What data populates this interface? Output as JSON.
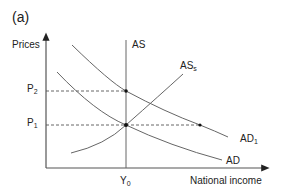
{
  "panel_label": "(a)",
  "axes": {
    "y_label": "Prices",
    "x_label": "National income"
  },
  "price_levels": {
    "p2": {
      "base": "P",
      "sub": "2"
    },
    "p1": {
      "base": "P",
      "sub": "1"
    }
  },
  "income_levels": {
    "y0": {
      "base": "Y",
      "sub": "0"
    }
  },
  "curves": {
    "as": {
      "base": "AS",
      "sub": ""
    },
    "ass": {
      "base": "AS",
      "sub": "s"
    },
    "ad1": {
      "base": "AD",
      "sub": "1"
    },
    "ad": {
      "base": "AD",
      "sub": ""
    }
  },
  "colors": {
    "line": "#555555",
    "text": "#222222"
  }
}
